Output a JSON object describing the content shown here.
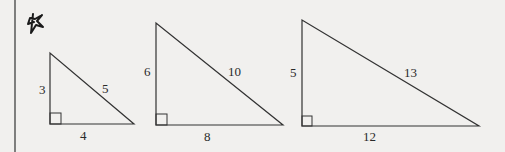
{
  "figure": {
    "marker_icon": "hand-drawn-star",
    "triangles": [
      {
        "leg_vertical": "3",
        "hypotenuse": "5",
        "leg_horizontal": "4"
      },
      {
        "leg_vertical": "6",
        "hypotenuse": "10",
        "leg_horizontal": "8"
      },
      {
        "leg_vertical": "5",
        "hypotenuse": "13",
        "leg_horizontal": "12"
      }
    ]
  },
  "colors": {
    "background": "#f1f0ee",
    "ink": "#2a2a2a"
  }
}
